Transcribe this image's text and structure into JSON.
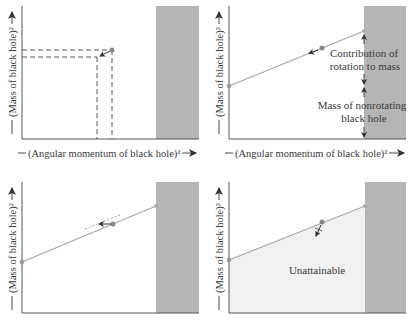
{
  "colors": {
    "axis": "#555555",
    "shaded_region": "#b5b5b5",
    "line": "#a8a8a8",
    "dot": "#8a8a8a",
    "unattainable_fill": "#f1f1f1",
    "text": "#3a3a3a"
  },
  "axis_labels": {
    "y": "(Mass of black hole)²",
    "x": "(Angular momentum of black hole)²"
  },
  "panels": [
    {
      "id": "top-left",
      "y_label": "(Mass of black hole)²",
      "x_label": "(Angular momentum of black hole)²",
      "description": "Dashed lines project a black hole state point onto mass and angular momentum axes; arrow shows state moving down-left"
    },
    {
      "id": "top-right",
      "y_label": "(Mass of black hole)²",
      "x_label": "(Angular momentum of black hole)²",
      "annotations": {
        "rotation": "Contribution of rotation to mass",
        "rotation_line1": "Contribution of",
        "rotation_line2": "rotation to mass",
        "nonrotating": "Mass of nonrotating black hole",
        "nonrotating_line1": "Mass of nonrotating",
        "nonrotating_line2": "black hole"
      }
    },
    {
      "id": "bottom-left",
      "y_label": "(Mass of black hole)²",
      "description": "State point moving along a line of constant irreducible mass"
    },
    {
      "id": "bottom-right",
      "y_label": "(Mass of black hole)²",
      "region_label": "Unattainable"
    }
  ]
}
